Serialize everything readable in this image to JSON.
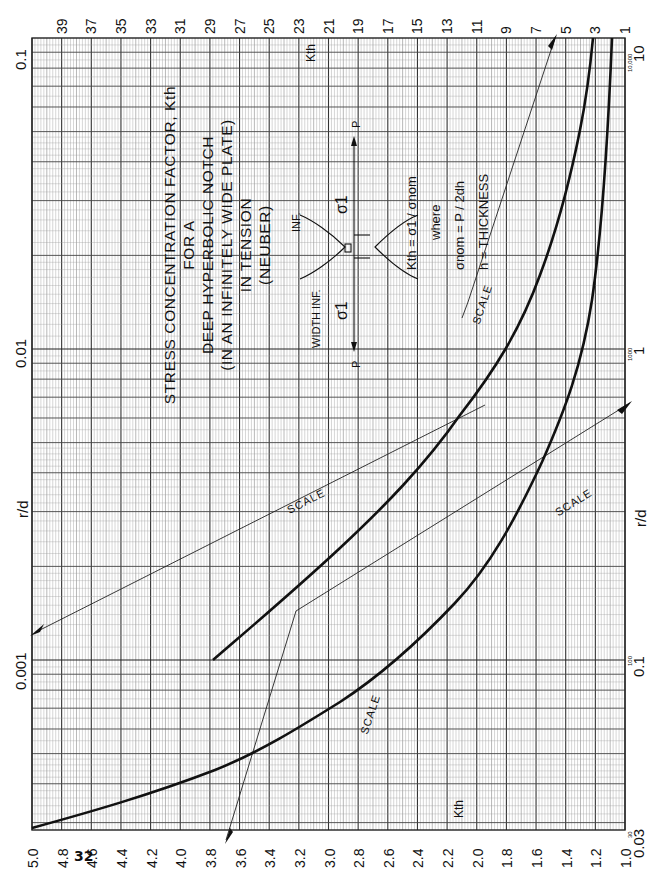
{
  "page": {
    "number": "32",
    "header_fragment": "Fig. 31"
  },
  "chart_data": {
    "type": "line",
    "title": "STRESS CONCENTRATION FACTOR, Kth FOR A DEEP HYPERBOLIC NOTCH (IN AN INFINITELY WIDE PLATE) IN TENSION (NEUBER)",
    "title_lines": [
      "STRESS CONCENTRATION FACTOR, Kth",
      "FOR A",
      "DEEP HYPERBOLIC NOTCH",
      "(IN AN INFINITELY WIDE PLATE)",
      "IN TENSION",
      "(NEUBER)"
    ],
    "orientation": "rotated 90° (printed sideways)",
    "xlabel": "Kth",
    "ylabel": "r/d",
    "x_axis_bottom": {
      "label": "Kth",
      "ticks": [
        "5.0",
        "4.8",
        "4.6",
        "4.4",
        "4.2",
        "4.0",
        "3.8",
        "3.6",
        "3.4",
        "3.2",
        "3.0",
        "2.8",
        "2.6",
        "2.4",
        "2.2",
        "2.0",
        "1.8",
        "1.6",
        "1.4",
        "1.2",
        "1.0"
      ],
      "range": [
        5.0,
        1.0
      ]
    },
    "x_axis_top": {
      "label": "Kth",
      "ticks": [
        "39",
        "37",
        "35",
        "33",
        "31",
        "29",
        "27",
        "25",
        "23",
        "21",
        "19",
        "17",
        "15",
        "13",
        "11",
        "9",
        "7",
        "5",
        "3",
        "1"
      ],
      "range": [
        40,
        1
      ]
    },
    "y_axis_left": {
      "label": "r/d",
      "scale": "log",
      "ticks": [
        "0.1",
        "0.01",
        "0.001"
      ],
      "range": [
        0.00028,
        0.1
      ]
    },
    "y_axis_right": {
      "label": "r/d",
      "scale": "log",
      "ticks": [
        "10",
        "1",
        "0.1",
        "0.03"
      ],
      "minor_ticks_small": [
        "10,000",
        "1000",
        "100",
        "30"
      ],
      "range": [
        0.028,
        10
      ]
    },
    "grid": true,
    "series": [
      {
        "name": "Kth curve (bottom Kth scale, left r/d scale)",
        "scale_pair": "bottom Kth 1.0–5.0 / left r/d",
        "points": [
          [
            5.0,
            0.00032
          ],
          [
            4.6,
            0.00045
          ],
          [
            4.2,
            0.0007
          ],
          [
            4.0,
            0.0008
          ],
          [
            3.6,
            0.0013
          ],
          [
            3.2,
            0.002
          ],
          [
            2.8,
            0.0032
          ],
          [
            2.4,
            0.0055
          ],
          [
            2.2,
            0.008
          ],
          [
            2.0,
            0.012
          ],
          [
            1.8,
            0.02
          ],
          [
            1.6,
            0.036
          ],
          [
            1.4,
            0.06
          ],
          [
            1.2,
            0.1
          ]
        ]
      },
      {
        "name": "Kth curve (top Kth scale, right r/d scale)",
        "scale_pair": "top Kth 1–39 / right r/d",
        "points": [
          [
            25,
            0.1
          ],
          [
            21,
            0.15
          ],
          [
            17,
            0.25
          ],
          [
            13,
            0.4
          ],
          [
            11,
            0.6
          ],
          [
            9,
            1.0
          ],
          [
            7,
            1.6
          ],
          [
            5,
            3.0
          ],
          [
            3,
            5.5
          ],
          [
            2,
            10
          ]
        ]
      }
    ],
    "annotations": [
      {
        "text": "SCALE",
        "note": "upper-left scale transfer line with arrow at left edge"
      },
      {
        "text": "SCALE",
        "note": "upper-right scale transfer line"
      },
      {
        "text": "SCALE",
        "note": "lower scale transfer line with arrow at bottom"
      },
      {
        "text": "SCALE",
        "note": "right scale transfer line with arrow at right edge"
      },
      {
        "text": "Kth",
        "note": "top scale label"
      },
      {
        "text": "Kth",
        "note": "bottom scale label"
      },
      {
        "text": "r/d",
        "note": "left axis label"
      },
      {
        "text": "r/d",
        "note": "right axis label"
      }
    ],
    "diagram": {
      "labels": [
        "WIDTH INF.",
        "INF.",
        "P",
        "P",
        "σ1",
        "σ1",
        "r",
        "d",
        "d",
        "d"
      ],
      "formula_lines": [
        "Kth = σ1 / σnom",
        "where",
        "σnom = P / 2dh",
        "h = THICKNESS"
      ]
    }
  },
  "labels": {
    "left_top": "0.1",
    "left_mid": "0.01",
    "left_low": "0.001",
    "left_axis": "r/d",
    "right_top": "10",
    "right_top_small": "10,000",
    "right_mid": "1",
    "right_mid_small": "1000",
    "right_low": "0.1",
    "right_low_small": "100",
    "right_bottom": "0.03",
    "right_bottom_small": "30",
    "right_axis": "r/d",
    "kth_top": "Kth",
    "kth_bottom": "Kth",
    "scale": "SCALE"
  }
}
